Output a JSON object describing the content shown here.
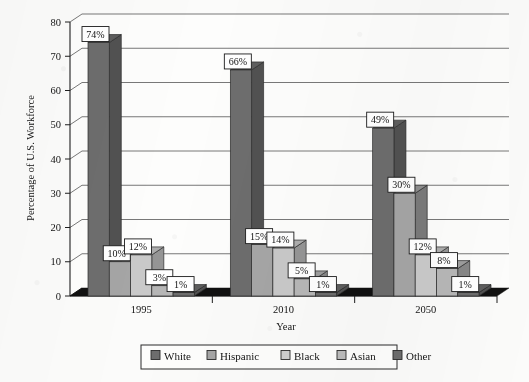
{
  "chart_data": {
    "type": "bar",
    "title": "",
    "subtitle": "",
    "xlabel": "Year",
    "ylabel": "Percentage of U.S. Workforce",
    "categories": [
      "1995",
      "2010",
      "2050"
    ],
    "series": [
      {
        "name": "White",
        "values": [
          74,
          66,
          49
        ],
        "labels": [
          "74%",
          "66%",
          "49%"
        ],
        "color": "#6d6d6d"
      },
      {
        "name": "Hispanic",
        "values": [
          10,
          15,
          30
        ],
        "labels": [
          "10%",
          "15%",
          "30%"
        ],
        "color": "#a5a5a5"
      },
      {
        "name": "Black",
        "values": [
          12,
          14,
          12
        ],
        "labels": [
          "12%",
          "14%",
          "12%"
        ],
        "color": "#c9c9c9"
      },
      {
        "name": "Asian",
        "values": [
          3,
          5,
          8
        ],
        "labels": [
          "3%",
          "5%",
          "8%"
        ],
        "color": "#b6b6b6"
      },
      {
        "name": "Other",
        "values": [
          1,
          1,
          1
        ],
        "labels": [
          "1%",
          "1%",
          "1%"
        ],
        "color": "#6d6d6d"
      }
    ],
    "ylim": [
      0,
      80
    ],
    "yticks": [
      0,
      10,
      20,
      30,
      40,
      50,
      60,
      70,
      80
    ],
    "ytick_labels": [
      "0",
      "10",
      "20",
      "30",
      "40",
      "50",
      "60",
      "70",
      "80"
    ],
    "grid": true,
    "legend_position": "bottom",
    "style": "3d-clustered-bar-grayscale"
  },
  "axes": {
    "y_title": "Percentage of U.S. Workforce",
    "x_title": "Year",
    "y_ticks": [
      "0",
      "10",
      "20",
      "30",
      "40",
      "50",
      "60",
      "70",
      "80"
    ],
    "x_ticks": [
      "1995",
      "2010",
      "2050"
    ]
  },
  "legend": {
    "items": [
      {
        "label": "White",
        "swatch": "#6d6d6d"
      },
      {
        "label": "Hispanic",
        "swatch": "#a5a5a5"
      },
      {
        "label": "Black",
        "swatch": "#cfcfcf"
      },
      {
        "label": "Asian",
        "swatch": "#bcbcbc"
      },
      {
        "label": "Other",
        "swatch": "#6d6d6d"
      }
    ]
  },
  "datalabels": {
    "g1995": [
      "74%",
      "10%",
      "12%",
      "3%",
      "1%"
    ],
    "g2010": [
      "66%",
      "15%",
      "14%",
      "5%",
      "1%"
    ],
    "g2050": [
      "49%",
      "30%",
      "12%",
      "8%",
      "1%"
    ]
  },
  "colors": {
    "white_series": "#6d6d6d",
    "hispanic_series": "#a5a5a5",
    "black_series": "#c9c9c9",
    "asian_series": "#b6b6b6",
    "other_series": "#6d6d6d",
    "grid": "#4a4a4a",
    "axis": "#1e1e1e",
    "floor": "#1a1a1a",
    "background": "#fbfbfa"
  }
}
